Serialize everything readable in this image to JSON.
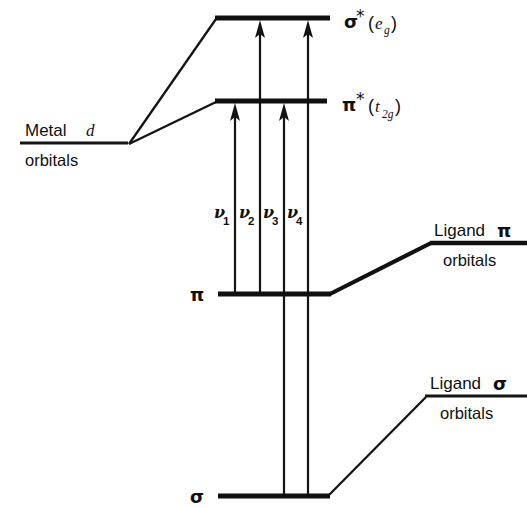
{
  "diagram": {
    "background_color": "#ffffff",
    "line_color": "#141414",
    "levels": [
      {
        "id": "sigma-star",
        "symbol": "σ",
        "star": "*",
        "paren_open": "(",
        "term": "e",
        "subscript": "g",
        "paren_close": ")",
        "full_label": "σ*(e_g)",
        "x1": 215,
        "x2": 330,
        "y": 18
      },
      {
        "id": "pi-star",
        "symbol": "π",
        "star": "*",
        "paren_open": "(",
        "term": "t",
        "subscript": "2g",
        "paren_close": ")",
        "full_label": "π*(t_2g)",
        "x1": 215,
        "x2": 327,
        "y": 101
      },
      {
        "id": "pi-bonding",
        "symbol": "π",
        "full_label": "π",
        "x1": 218,
        "x2": 331,
        "y": 294
      },
      {
        "id": "sigma-bonding",
        "symbol": "σ",
        "full_label": "σ",
        "x1": 218,
        "x2": 330,
        "y": 496
      }
    ],
    "fragments": [
      {
        "id": "metal-d",
        "line1_text": "Metal",
        "line1_italic": "d",
        "line2_text": "orbitals",
        "rule_x1": 20,
        "rule_x2": 128,
        "rule_y": 143
      },
      {
        "id": "ligand-pi",
        "line1_text": "Ligand",
        "line1_symbol": "π",
        "line2_text": "orbitals",
        "rule_x1": 430,
        "rule_x2": 527,
        "rule_y": 243
      },
      {
        "id": "ligand-sigma",
        "line1_text": "Ligand",
        "line1_symbol": "σ",
        "line2_text": "orbitals",
        "rule_x1": 425,
        "rule_x2": 527,
        "rule_y": 396
      }
    ],
    "transitions": [
      {
        "id": "nu1",
        "label": "ν",
        "subscript": "1",
        "x": 235,
        "from_level": "pi-bonding",
        "to_level": "pi-star",
        "y_start": 294,
        "y_end": 104,
        "label_x": 215,
        "label_y": 218
      },
      {
        "id": "nu2",
        "label": "ν",
        "subscript": "2",
        "x": 260,
        "from_level": "pi-bonding",
        "to_level": "sigma-star",
        "y_start": 294,
        "y_end": 21,
        "label_x": 240,
        "label_y": 218
      },
      {
        "id": "nu3",
        "label": "ν",
        "subscript": "3",
        "x": 284,
        "from_level": "sigma-bonding",
        "to_level": "pi-star",
        "y_start": 496,
        "y_end": 104,
        "label_x": 264,
        "label_y": 218
      },
      {
        "id": "nu4",
        "label": "ν",
        "subscript": "4",
        "x": 308,
        "from_level": "sigma-bonding",
        "to_level": "sigma-star",
        "y_start": 496,
        "y_end": 21,
        "label_x": 288,
        "label_y": 218
      }
    ],
    "connectors": [
      {
        "id": "metal-d-to-sigma-star",
        "x1": 129,
        "y1": 144,
        "x2": 216,
        "y2": 19,
        "weight": "thin"
      },
      {
        "id": "metal-d-to-pi-star",
        "x1": 129,
        "y1": 144,
        "x2": 216,
        "y2": 102,
        "weight": "thin"
      },
      {
        "id": "pi-to-ligand-pi",
        "x1": 330,
        "y1": 294,
        "x2": 431,
        "y2": 243,
        "weight": "thick"
      },
      {
        "id": "sigma-to-ligand-sigma",
        "x1": 329,
        "y1": 495,
        "x2": 426,
        "y2": 397,
        "weight": "thin"
      }
    ]
  }
}
